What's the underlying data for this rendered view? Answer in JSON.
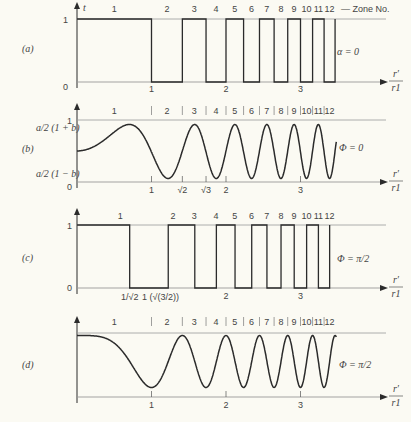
{
  "figure": {
    "zone_label": "Zone No.",
    "xaxis_label_num": "r′",
    "xaxis_label_den": "r1",
    "zones": [
      "1",
      "2",
      "3",
      "4",
      "5",
      "6",
      "7",
      "8",
      "9",
      "10",
      "11",
      "12"
    ]
  },
  "panels": [
    {
      "id": "(a)",
      "param": "α = 0",
      "y_top": "1",
      "y_bottom": "0",
      "y_axis_label": "t",
      "x_ticks": [
        "1",
        "2",
        "3"
      ]
    },
    {
      "id": "(b)",
      "param": "Φ = 0",
      "y_top": "1",
      "y_upper": "a/2 (1 + b)",
      "y_lower": "a/2 (1 − b)",
      "y_bottom": "0",
      "x_ticks": [
        "1",
        "√2",
        "√3",
        "2",
        "3"
      ]
    },
    {
      "id": "(c)",
      "param": "Φ = π/2",
      "y_top": "1",
      "y_bottom": "0",
      "x_ticks": [
        "1/√2",
        "1 (√(3/2))",
        "2",
        "3"
      ]
    },
    {
      "id": "(d)",
      "param": "Φ = π/2",
      "x_ticks": [
        "1",
        "2",
        "3"
      ]
    }
  ],
  "chart_data": [
    {
      "type": "line",
      "title": "(a) α = 0 — binary zone-plate transmittance",
      "xlabel": "r′/r1",
      "ylabel": "t",
      "description": "Square wave: 1 in odd zones, 0 in even zones; zone boundaries at r′/r1 = √n",
      "x_boundaries": [
        1,
        1.414,
        1.732,
        2,
        2.236,
        2.449,
        2.646,
        2.828,
        3,
        3.162,
        3.317,
        3.464
      ],
      "values": [
        1,
        0,
        1,
        0,
        1,
        0,
        1,
        0,
        1,
        0,
        1,
        0
      ],
      "ylim": [
        0,
        1
      ]
    },
    {
      "type": "line",
      "title": "(b) Φ = 0 — sinusoidal transmittance",
      "xlabel": "r′/r1",
      "description": "t = a/2 (1 + b cos(π (r′/r1)²)), oscillating between a/2(1−b) and a/2(1+b)",
      "ylim": [
        0,
        1
      ]
    },
    {
      "type": "line",
      "title": "(c) Φ = π/2 — shifted binary zones",
      "xlabel": "r′/r1",
      "description": "Square wave shifted: boundaries at √(n−1/2)",
      "x_boundaries": [
        0.707,
        1.225,
        1.581,
        1.871,
        2.121,
        2.345,
        2.55,
        2.739,
        2.915,
        3.082,
        3.24,
        3.391
      ],
      "values": [
        1,
        0,
        1,
        0,
        1,
        0,
        1,
        0,
        1,
        0,
        1,
        0
      ],
      "ylim": [
        0,
        1
      ]
    },
    {
      "type": "line",
      "title": "(d) Φ = π/2 — shifted sinusoid",
      "xlabel": "r′/r1",
      "description": "t = a/2 (1 + b sin(π (r′/r1)²) ) style curve, minima at r′/r1 = 1, √3...",
      "ylim": [
        0,
        1
      ]
    }
  ]
}
